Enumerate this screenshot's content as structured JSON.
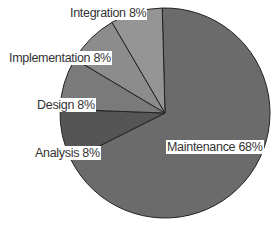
{
  "chart_data": {
    "type": "pie",
    "title": "",
    "start_angle_deg": 0,
    "direction": "clockwise",
    "slices": [
      {
        "label": "Maintenance",
        "value": 68,
        "display": "Maintenance 68%",
        "color": "#6b6b6b"
      },
      {
        "label": "Analysis",
        "value": 8,
        "display": "Analysis 8%",
        "color": "#555555"
      },
      {
        "label": "Design",
        "value": 8,
        "display": "Design 8%",
        "color": "#7a7a7a"
      },
      {
        "label": "Implementation",
        "value": 8,
        "display": "Implementation 8%",
        "color": "#8c8c8c"
      },
      {
        "label": "Integration",
        "value": 8,
        "display": "Integration 8%",
        "color": "#959595"
      }
    ],
    "legend": "none",
    "labels_inline": true
  }
}
